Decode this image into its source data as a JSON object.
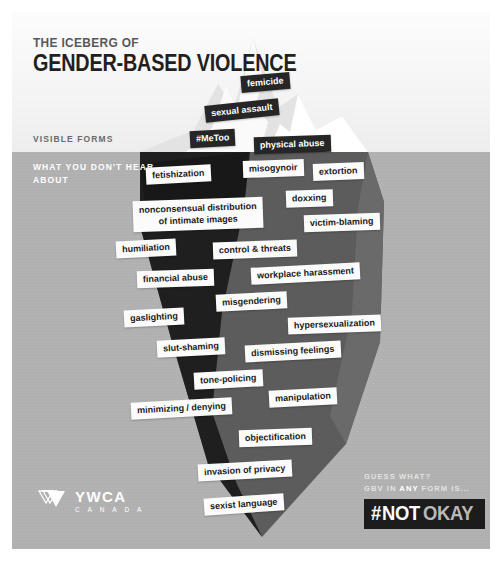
{
  "title": {
    "line1": "THE ICEBERG OF",
    "line2": "GENDER-BASED VIOLENCE"
  },
  "sections": {
    "visible": "VISIBLE FORMS",
    "hidden": "WHAT YOU DON'T HEAR\nABOUT"
  },
  "colors": {
    "sky": "#f4f4f4",
    "sea": "#b0b0b0",
    "iceberg_light": "#e9e9e9",
    "iceberg_mid": "#5a5a5a",
    "iceberg_dark": "#212121",
    "tag_dark_bg": "#262626",
    "tag_light_bg": "#fbfbfb",
    "text_dark": "#231f20",
    "text_muted": "#6a6a6c"
  },
  "visible_tags": [
    {
      "label": "femicide",
      "x": 241,
      "y": 74,
      "rot": -5,
      "size": 9.0
    },
    {
      "label": "sexual assault",
      "x": 205,
      "y": 102,
      "rot": -6,
      "size": 9.0
    },
    {
      "label": "#MeToo",
      "x": 190,
      "y": 130,
      "rot": -3,
      "size": 9.0
    },
    {
      "label": "physical abuse",
      "x": 254,
      "y": 136,
      "rot": -2,
      "size": 9.0
    }
  ],
  "hidden_tags": [
    {
      "label": "fetishization",
      "x": 146,
      "y": 166,
      "rot": -3,
      "size": 9.0
    },
    {
      "label": "misogynoir",
      "x": 243,
      "y": 160,
      "rot": -2,
      "size": 9.0
    },
    {
      "label": "extortion",
      "x": 313,
      "y": 163,
      "rot": -2,
      "size": 9.0
    },
    {
      "label": "doxxing",
      "x": 286,
      "y": 190,
      "rot": -2,
      "size": 9.0
    },
    {
      "label": "nonconsensual distribution\nof intimate images",
      "x": 133,
      "y": 199,
      "rot": -2,
      "size": 9.0,
      "two": true
    },
    {
      "label": "victim-blaming",
      "x": 304,
      "y": 214,
      "rot": -2,
      "size": 9.0
    },
    {
      "label": "humiliation",
      "x": 116,
      "y": 240,
      "rot": -3,
      "size": 9.0
    },
    {
      "label": "control & threats",
      "x": 213,
      "y": 241,
      "rot": -2,
      "size": 9.0
    },
    {
      "label": "workplace harassment",
      "x": 251,
      "y": 265,
      "rot": -3,
      "size": 9.0
    },
    {
      "label": "financial abuse",
      "x": 137,
      "y": 270,
      "rot": -2,
      "size": 9.0
    },
    {
      "label": "misgendering",
      "x": 216,
      "y": 293,
      "rot": -3,
      "size": 9.0
    },
    {
      "label": "gaslighting",
      "x": 124,
      "y": 309,
      "rot": -3,
      "size": 9.0
    },
    {
      "label": "hypersexualization",
      "x": 288,
      "y": 316,
      "rot": -2,
      "size": 9.0
    },
    {
      "label": "slut-shaming",
      "x": 157,
      "y": 339,
      "rot": -3,
      "size": 9.0
    },
    {
      "label": "dismissing feelings",
      "x": 245,
      "y": 343,
      "rot": -3,
      "size": 9.0
    },
    {
      "label": "tone-policing",
      "x": 194,
      "y": 371,
      "rot": -3,
      "size": 9.0
    },
    {
      "label": "manipulation",
      "x": 269,
      "y": 389,
      "rot": -3,
      "size": 9.0
    },
    {
      "label": "minimizing / denying",
      "x": 131,
      "y": 400,
      "rot": -3,
      "size": 9.0
    },
    {
      "label": "objectification",
      "x": 239,
      "y": 429,
      "rot": -2,
      "size": 9.0
    },
    {
      "label": "invasion of privacy",
      "x": 198,
      "y": 462,
      "rot": -3,
      "size": 9.0
    },
    {
      "label": "sexist language",
      "x": 204,
      "y": 496,
      "rot": -4,
      "size": 9.0
    }
  ],
  "logo": {
    "name": "YWCA",
    "sub": "C A N A D A"
  },
  "callout": {
    "line1": "GUESS WHAT?",
    "line2_a": "GBV IN ",
    "line2_b": "ANY",
    "line2_c": " FORM IS...",
    "hash": "#",
    "not": "NOT",
    "okay": "OKAY"
  }
}
